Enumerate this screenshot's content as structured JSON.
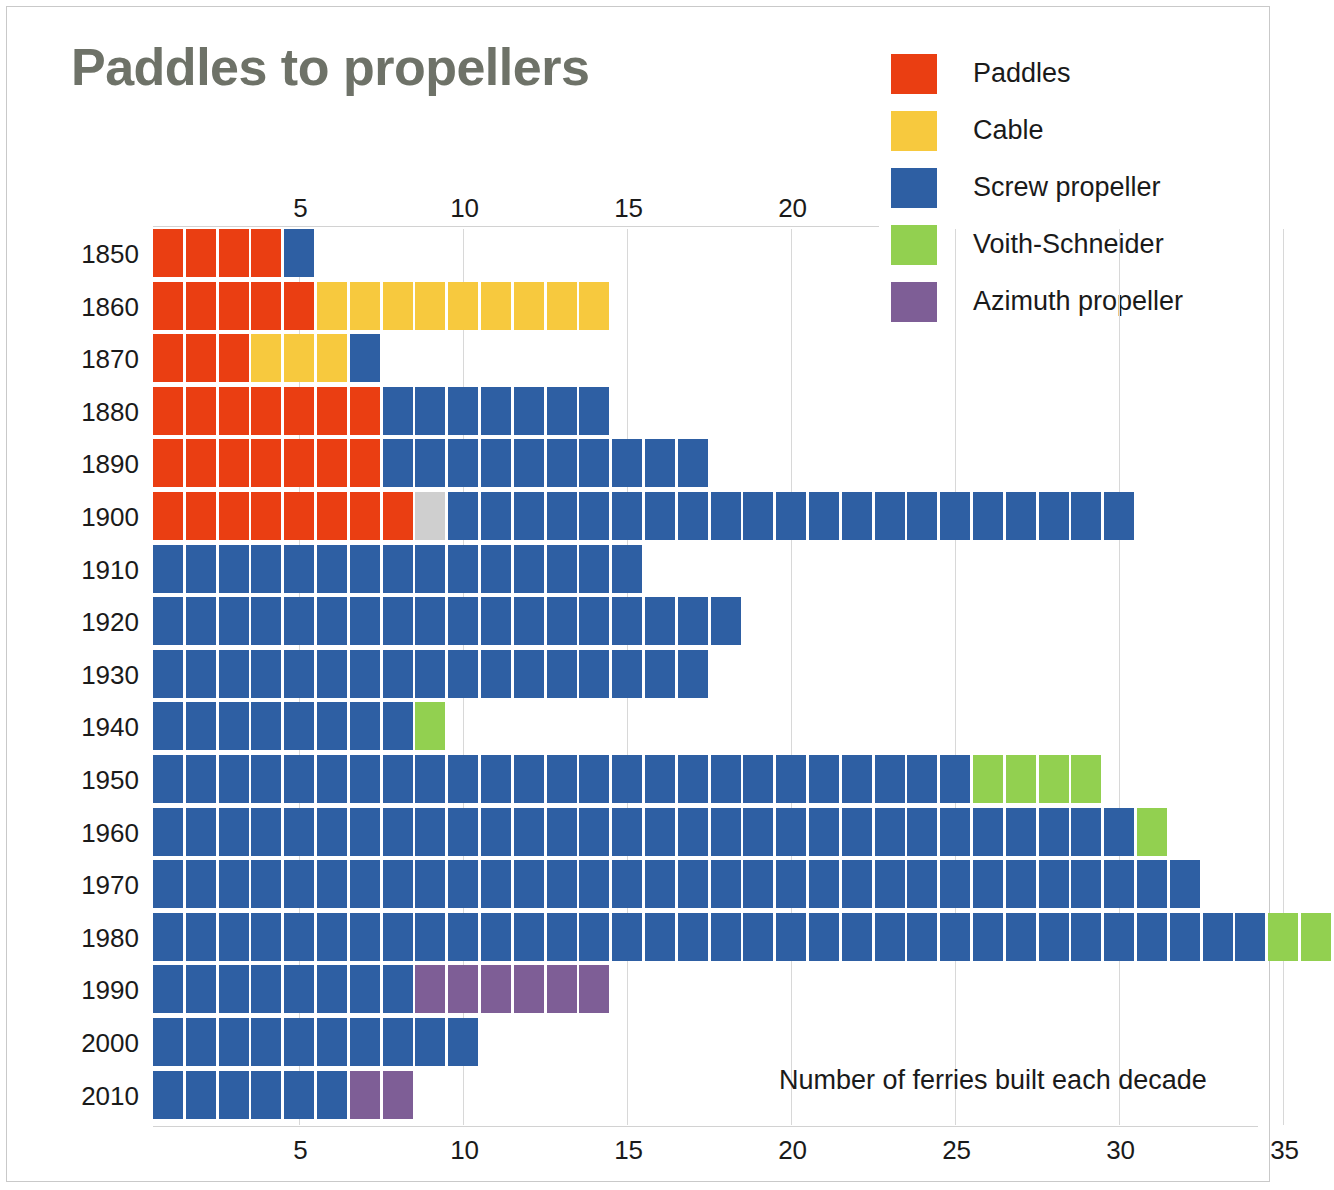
{
  "title": "Paddles to propellers",
  "caption": "Number of ferries built each decade",
  "legend": [
    {
      "label": "Paddles",
      "key": "paddles",
      "color": "#EA3E12"
    },
    {
      "label": "Cable",
      "key": "cable",
      "color": "#F7C93E"
    },
    {
      "label": "Screw propeller",
      "key": "screw",
      "color": "#2E5FA3"
    },
    {
      "label": "Voith-Schneider",
      "key": "voith",
      "color": "#92D050"
    },
    {
      "label": "Azimuth propeller",
      "key": "azimuth",
      "color": "#7E5E96"
    }
  ],
  "colors": {
    "paddles": "#EA3E12",
    "cable": "#F7C93E",
    "screw": "#2E5FA3",
    "voith": "#92D050",
    "azimuth": "#7E5E96",
    "unknown": "#CFCFCF",
    "title": "#6e7268",
    "grid": "#d8d8d8",
    "frame": "#c9c9c9"
  },
  "axis": {
    "top_ticks": [
      5,
      10,
      15,
      20
    ],
    "bottom_ticks": [
      5,
      10,
      15,
      20,
      25,
      30,
      35
    ],
    "max": 37,
    "unit_label": "ferries"
  },
  "chart_data": {
    "type": "bar",
    "subtype": "stacked-unit-waffle",
    "title": "Paddles to propellers",
    "xlabel": "Number of ferries built each decade",
    "ylabel": "",
    "xlim": [
      0,
      37
    ],
    "grid": true,
    "legend_position": "top-right",
    "categories": [
      "1850",
      "1860",
      "1870",
      "1880",
      "1890",
      "1900",
      "1910",
      "1920",
      "1930",
      "1940",
      "1950",
      "1960",
      "1970",
      "1980",
      "1990",
      "2000",
      "2010"
    ],
    "series": [
      {
        "name": "Paddles",
        "key": "paddles",
        "values": [
          4,
          5,
          3,
          7,
          7,
          8,
          0,
          0,
          0,
          0,
          0,
          0,
          0,
          0,
          0,
          0,
          0
        ]
      },
      {
        "name": "Cable",
        "key": "cable",
        "values": [
          0,
          9,
          3,
          0,
          0,
          0,
          0,
          0,
          0,
          0,
          0,
          0,
          0,
          0,
          0,
          0,
          0
        ]
      },
      {
        "name": "Unknown",
        "key": "unknown",
        "values": [
          0,
          0,
          0,
          0,
          0,
          1,
          0,
          0,
          0,
          0,
          0,
          0,
          0,
          0,
          0,
          0,
          0
        ]
      },
      {
        "name": "Screw propeller",
        "key": "screw",
        "values": [
          1,
          0,
          1,
          7,
          10,
          21,
          15,
          18,
          17,
          8,
          25,
          30,
          32,
          34,
          8,
          10,
          6
        ]
      },
      {
        "name": "Voith-Schneider",
        "key": "voith",
        "values": [
          0,
          0,
          0,
          0,
          0,
          0,
          0,
          0,
          0,
          1,
          4,
          1,
          0,
          2,
          0,
          0,
          0
        ]
      },
      {
        "name": "Azimuth propeller",
        "key": "azimuth",
        "values": [
          0,
          0,
          0,
          0,
          0,
          0,
          0,
          0,
          0,
          0,
          0,
          0,
          0,
          0,
          6,
          0,
          2
        ]
      }
    ],
    "totals": [
      5,
      14,
      7,
      14,
      17,
      30,
      15,
      18,
      17,
      9,
      29,
      31,
      32,
      36,
      14,
      10,
      8
    ],
    "rows": [
      {
        "year": "1850",
        "cells": [
          "paddles",
          "paddles",
          "paddles",
          "paddles",
          "screw"
        ]
      },
      {
        "year": "1860",
        "cells": [
          "paddles",
          "paddles",
          "paddles",
          "paddles",
          "paddles",
          "cable",
          "cable",
          "cable",
          "cable",
          "cable",
          "cable",
          "cable",
          "cable",
          "cable"
        ]
      },
      {
        "year": "1870",
        "cells": [
          "paddles",
          "paddles",
          "paddles",
          "cable",
          "cable",
          "cable",
          "screw"
        ]
      },
      {
        "year": "1880",
        "cells": [
          "paddles",
          "paddles",
          "paddles",
          "paddles",
          "paddles",
          "paddles",
          "paddles",
          "screw",
          "screw",
          "screw",
          "screw",
          "screw",
          "screw",
          "screw"
        ]
      },
      {
        "year": "1890",
        "cells": [
          "paddles",
          "paddles",
          "paddles",
          "paddles",
          "paddles",
          "paddles",
          "paddles",
          "screw",
          "screw",
          "screw",
          "screw",
          "screw",
          "screw",
          "screw",
          "screw",
          "screw",
          "screw"
        ]
      },
      {
        "year": "1900",
        "cells": [
          "paddles",
          "paddles",
          "paddles",
          "paddles",
          "paddles",
          "paddles",
          "paddles",
          "paddles",
          "unknown",
          "screw",
          "screw",
          "screw",
          "screw",
          "screw",
          "screw",
          "screw",
          "screw",
          "screw",
          "screw",
          "screw",
          "screw",
          "screw",
          "screw",
          "screw",
          "screw",
          "screw",
          "screw",
          "screw",
          "screw",
          "screw"
        ]
      },
      {
        "year": "1910",
        "cells": [
          "screw",
          "screw",
          "screw",
          "screw",
          "screw",
          "screw",
          "screw",
          "screw",
          "screw",
          "screw",
          "screw",
          "screw",
          "screw",
          "screw",
          "screw"
        ]
      },
      {
        "year": "1920",
        "cells": [
          "screw",
          "screw",
          "screw",
          "screw",
          "screw",
          "screw",
          "screw",
          "screw",
          "screw",
          "screw",
          "screw",
          "screw",
          "screw",
          "screw",
          "screw",
          "screw",
          "screw",
          "screw"
        ]
      },
      {
        "year": "1930",
        "cells": [
          "screw",
          "screw",
          "screw",
          "screw",
          "screw",
          "screw",
          "screw",
          "screw",
          "screw",
          "screw",
          "screw",
          "screw",
          "screw",
          "screw",
          "screw",
          "screw",
          "screw"
        ]
      },
      {
        "year": "1940",
        "cells": [
          "screw",
          "screw",
          "screw",
          "screw",
          "screw",
          "screw",
          "screw",
          "screw",
          "voith"
        ]
      },
      {
        "year": "1950",
        "cells": [
          "screw",
          "screw",
          "screw",
          "screw",
          "screw",
          "screw",
          "screw",
          "screw",
          "screw",
          "screw",
          "screw",
          "screw",
          "screw",
          "screw",
          "screw",
          "screw",
          "screw",
          "screw",
          "screw",
          "screw",
          "screw",
          "screw",
          "screw",
          "screw",
          "screw",
          "voith",
          "voith",
          "voith",
          "voith"
        ]
      },
      {
        "year": "1960",
        "cells": [
          "screw",
          "screw",
          "screw",
          "screw",
          "screw",
          "screw",
          "screw",
          "screw",
          "screw",
          "screw",
          "screw",
          "screw",
          "screw",
          "screw",
          "screw",
          "screw",
          "screw",
          "screw",
          "screw",
          "screw",
          "screw",
          "screw",
          "screw",
          "screw",
          "screw",
          "screw",
          "screw",
          "screw",
          "screw",
          "screw",
          "voith"
        ]
      },
      {
        "year": "1970",
        "cells": [
          "screw",
          "screw",
          "screw",
          "screw",
          "screw",
          "screw",
          "screw",
          "screw",
          "screw",
          "screw",
          "screw",
          "screw",
          "screw",
          "screw",
          "screw",
          "screw",
          "screw",
          "screw",
          "screw",
          "screw",
          "screw",
          "screw",
          "screw",
          "screw",
          "screw",
          "screw",
          "screw",
          "screw",
          "screw",
          "screw",
          "screw",
          "screw"
        ]
      },
      {
        "year": "1980",
        "cells": [
          "screw",
          "screw",
          "screw",
          "screw",
          "screw",
          "screw",
          "screw",
          "screw",
          "screw",
          "screw",
          "screw",
          "screw",
          "screw",
          "screw",
          "screw",
          "screw",
          "screw",
          "screw",
          "screw",
          "screw",
          "screw",
          "screw",
          "screw",
          "screw",
          "screw",
          "screw",
          "screw",
          "screw",
          "screw",
          "screw",
          "screw",
          "screw",
          "screw",
          "screw",
          "voith",
          "voith"
        ]
      },
      {
        "year": "1990",
        "cells": [
          "screw",
          "screw",
          "screw",
          "screw",
          "screw",
          "screw",
          "screw",
          "screw",
          "azimuth",
          "azimuth",
          "azimuth",
          "azimuth",
          "azimuth",
          "azimuth"
        ]
      },
      {
        "year": "2000",
        "cells": [
          "screw",
          "screw",
          "screw",
          "screw",
          "screw",
          "screw",
          "screw",
          "screw",
          "screw",
          "screw"
        ]
      },
      {
        "year": "2010",
        "cells": [
          "screw",
          "screw",
          "screw",
          "screw",
          "screw",
          "screw",
          "azimuth",
          "azimuth"
        ]
      }
    ]
  }
}
